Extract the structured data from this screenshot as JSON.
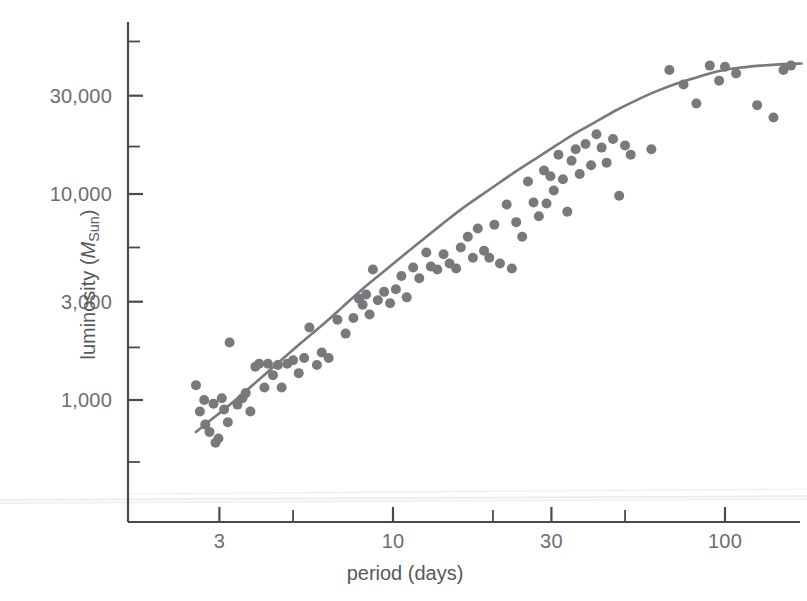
{
  "figure": {
    "background_color": "#ffffff",
    "axis_color": "#4a4a4a",
    "text_color": "#6e6e6e",
    "point_color": "#78797c",
    "curve_color": "#78797c",
    "width": 807,
    "height": 601
  },
  "chart_data": {
    "type": "scatter",
    "title": "",
    "subtitle": "",
    "xlabel": "period (days)",
    "ylabel": "luminosity (MSun)",
    "ylabel_parts": {
      "prefix": "luminosity (",
      "symbol": "M",
      "subscript": "Sun",
      "suffix": ")"
    },
    "xscale": "log",
    "yscale": "log",
    "xlim": [
      2.0,
      190.0
    ],
    "ylim": [
      420,
      90000
    ],
    "grid": false,
    "legend": null,
    "xticks": [
      3,
      10,
      30,
      100
    ],
    "xtick_labels": [
      "3",
      "10",
      "30",
      "100"
    ],
    "xminor_ticks": [
      5,
      20,
      50,
      200
    ],
    "yticks": [
      1000,
      3000,
      10000,
      30000
    ],
    "ytick_labels": [
      "1,000",
      "3,000",
      "10,000",
      "30,000"
    ],
    "yminor_ticks": [
      500,
      1800,
      5500,
      17000,
      55000
    ],
    "series": [
      {
        "name": "Cepheid variables",
        "marker": "circle",
        "marker_size_px": 10,
        "points": [
          [
            2.55,
            1180
          ],
          [
            2.62,
            880
          ],
          [
            2.7,
            1000
          ],
          [
            2.72,
            760
          ],
          [
            2.8,
            700
          ],
          [
            2.88,
            960
          ],
          [
            2.92,
            620
          ],
          [
            2.98,
            650
          ],
          [
            3.05,
            1020
          ],
          [
            3.1,
            900
          ],
          [
            3.18,
            780
          ],
          [
            3.22,
            1900
          ],
          [
            3.4,
            950
          ],
          [
            3.52,
            1020
          ],
          [
            3.6,
            1080
          ],
          [
            3.72,
            880
          ],
          [
            3.85,
            1450
          ],
          [
            3.95,
            1500
          ],
          [
            4.1,
            1150
          ],
          [
            4.2,
            1500
          ],
          [
            4.35,
            1320
          ],
          [
            4.5,
            1480
          ],
          [
            4.62,
            1150
          ],
          [
            4.8,
            1500
          ],
          [
            5.0,
            1560
          ],
          [
            5.2,
            1350
          ],
          [
            5.4,
            1600
          ],
          [
            5.6,
            2250
          ],
          [
            5.9,
            1480
          ],
          [
            6.1,
            1700
          ],
          [
            6.4,
            1600
          ],
          [
            6.8,
            2450
          ],
          [
            7.2,
            2100
          ],
          [
            7.6,
            2500
          ],
          [
            7.9,
            3100
          ],
          [
            8.1,
            2900
          ],
          [
            8.3,
            3250
          ],
          [
            8.5,
            2600
          ],
          [
            8.7,
            4300
          ],
          [
            9.0,
            3050
          ],
          [
            9.4,
            3350
          ],
          [
            9.8,
            2950
          ],
          [
            10.2,
            3450
          ],
          [
            10.6,
            4000
          ],
          [
            11.0,
            3150
          ],
          [
            11.5,
            4400
          ],
          [
            12.0,
            3900
          ],
          [
            12.6,
            5200
          ],
          [
            13.0,
            4450
          ],
          [
            13.6,
            4300
          ],
          [
            14.2,
            5100
          ],
          [
            14.8,
            4600
          ],
          [
            15.5,
            4350
          ],
          [
            16.0,
            5500
          ],
          [
            16.8,
            6200
          ],
          [
            17.4,
            4900
          ],
          [
            18.0,
            6800
          ],
          [
            18.8,
            5300
          ],
          [
            19.5,
            4900
          ],
          [
            20.2,
            7100
          ],
          [
            21.0,
            4600
          ],
          [
            22.0,
            8900
          ],
          [
            22.8,
            4350
          ],
          [
            23.5,
            7300
          ],
          [
            24.5,
            6200
          ],
          [
            25.5,
            11500
          ],
          [
            26.5,
            9100
          ],
          [
            27.5,
            7800
          ],
          [
            28.5,
            13000
          ],
          [
            29.0,
            9000
          ],
          [
            29.8,
            12200
          ],
          [
            30.5,
            10400
          ],
          [
            31.5,
            15500
          ],
          [
            32.5,
            11800
          ],
          [
            33.5,
            8200
          ],
          [
            34.5,
            14500
          ],
          [
            35.5,
            16500
          ],
          [
            36.5,
            12500
          ],
          [
            38.0,
            17500
          ],
          [
            39.5,
            13800
          ],
          [
            41.0,
            19500
          ],
          [
            42.5,
            16800
          ],
          [
            44.0,
            14200
          ],
          [
            46.0,
            18500
          ],
          [
            48.0,
            9800
          ],
          [
            50.0,
            17200
          ],
          [
            52.0,
            15500
          ],
          [
            60.0,
            16500
          ],
          [
            68.0,
            40000
          ],
          [
            75.0,
            34000
          ],
          [
            82.0,
            27500
          ],
          [
            90.0,
            42000
          ],
          [
            96.0,
            35500
          ],
          [
            100.0,
            41500
          ],
          [
            108.0,
            38500
          ],
          [
            125.0,
            27000
          ],
          [
            140.0,
            23500
          ],
          [
            150.0,
            40000
          ],
          [
            158.0,
            42000
          ]
        ]
      }
    ],
    "fit_curve": {
      "name": "period-luminosity relation",
      "points": [
        [
          2.55,
          700
        ],
        [
          2.8,
          790
        ],
        [
          3.1,
          900
        ],
        [
          3.5,
          1060
        ],
        [
          4.0,
          1280
        ],
        [
          4.6,
          1560
        ],
        [
          5.3,
          1900
        ],
        [
          6.1,
          2300
        ],
        [
          7.0,
          2800
        ],
        [
          8.0,
          3400
        ],
        [
          9.2,
          4100
        ],
        [
          10.6,
          4950
        ],
        [
          12.2,
          5950
        ],
        [
          14.0,
          7100
        ],
        [
          16.0,
          8400
        ],
        [
          18.5,
          9900
        ],
        [
          21.0,
          11400
        ],
        [
          24.0,
          13200
        ],
        [
          27.5,
          15200
        ],
        [
          31.5,
          17500
        ],
        [
          36.0,
          20000
        ],
        [
          41.0,
          22500
        ],
        [
          47.0,
          25500
        ],
        [
          54.0,
          28500
        ],
        [
          62.0,
          31500
        ],
        [
          72.0,
          34500
        ],
        [
          83.0,
          37000
        ],
        [
          96.0,
          39500
        ],
        [
          110.0,
          41000
        ],
        [
          128.0,
          42000
        ],
        [
          150.0,
          42700
        ],
        [
          170.0,
          43000
        ]
      ]
    }
  },
  "artifacts": {
    "scan_line_note": "faint horizontal scan artifact near lower edge"
  }
}
